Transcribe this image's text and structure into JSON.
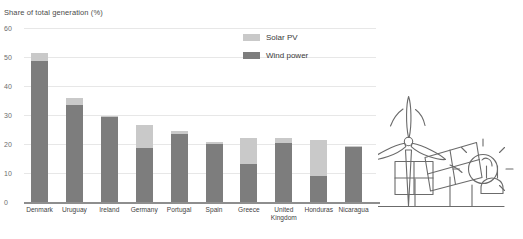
{
  "chart_data": {
    "type": "bar",
    "title": "",
    "subtitle": "",
    "ylabel": "Share of total generation (%)",
    "xlabel": "",
    "ylim": [
      0,
      60
    ],
    "yticks": [
      0,
      10,
      20,
      30,
      40,
      50,
      60
    ],
    "ytick_labels": [
      "0",
      "10",
      "20",
      "30",
      "40",
      "50",
      "60"
    ],
    "grid": true,
    "stacked": true,
    "legend_position": "top-center",
    "categories": [
      "Denmark",
      "Uruguay",
      "Ireland",
      "Germany",
      "Portugal",
      "Spain",
      "Greece",
      "United Kingdom",
      "Honduras",
      "Nicaragua"
    ],
    "series": [
      {
        "name": "Wind power",
        "color": "#7d7d7d",
        "values": [
          48.5,
          33.5,
          29.3,
          18.5,
          23.3,
          20.0,
          13.0,
          20.5,
          9.0,
          19.0
        ]
      },
      {
        "name": "Solar PV",
        "color": "#c9c9c9",
        "values": [
          3.0,
          2.2,
          0.5,
          8.0,
          1.3,
          0.8,
          9.0,
          1.5,
          12.5,
          0.3
        ]
      }
    ],
    "totals": [
      51.5,
      35.7,
      29.8,
      26.5,
      24.6,
      20.8,
      22.0,
      22.0,
      21.5,
      19.3
    ]
  },
  "axis": {
    "y_title": "Share of total generation (%)"
  },
  "legend": {
    "items": [
      {
        "label": "Solar PV",
        "color": "#c9c9c9",
        "swatch_name": "solar-pv-swatch"
      },
      {
        "label": "Wind power",
        "color": "#7d7d7d",
        "swatch_name": "wind-power-swatch"
      }
    ]
  },
  "illustration": {
    "name": "renewable-energy-line-art",
    "elements": [
      "wind-turbine",
      "solar-panels",
      "sun",
      "electric-plug",
      "ground-line"
    ],
    "stroke_color": "#6b6b6b"
  },
  "colors": {
    "wind": "#7d7d7d",
    "solar": "#c9c9c9",
    "grid": "#e7e7e7",
    "axis": "#8e8e8e",
    "text": "#3a3a3a"
  }
}
